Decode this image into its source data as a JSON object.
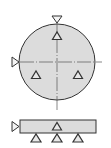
{
  "diagram": {
    "type": "datum-target-drawing",
    "colors": {
      "fill": "#dcdcdc",
      "stroke": "#333333",
      "centerline": "#555555",
      "background": "#ffffff"
    },
    "top_view": {
      "shape": "circle",
      "markers": [
        {
          "name": "datum-arrow-top",
          "direction": "down"
        },
        {
          "name": "datum-arrow-left",
          "direction": "right"
        },
        {
          "name": "target-top",
          "direction": "up"
        },
        {
          "name": "target-lower-left",
          "direction": "up"
        },
        {
          "name": "target-lower-right",
          "direction": "up"
        }
      ]
    },
    "side_view": {
      "shape": "rectangle",
      "markers": [
        {
          "name": "datum-arrow-left",
          "direction": "right"
        },
        {
          "name": "target-center",
          "direction": "up"
        },
        {
          "name": "support-left",
          "direction": "up"
        },
        {
          "name": "support-center",
          "direction": "up"
        },
        {
          "name": "support-right",
          "direction": "up"
        }
      ]
    }
  }
}
